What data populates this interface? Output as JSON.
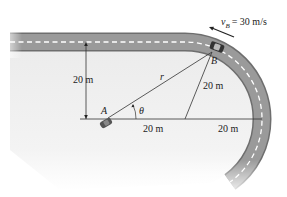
{
  "figure": {
    "velocity_label": "v",
    "velocity_sub": "B",
    "velocity_value": "= 30 m/s",
    "point_A": "A",
    "point_B": "B",
    "radius_label": "r",
    "angle_label": "θ",
    "dim_vertical": "20 m",
    "dim_diagonal": "20 m",
    "dim_horizontal_left": "20 m",
    "dim_horizontal_right": "20 m"
  },
  "colors": {
    "road": "#8f8f8f",
    "road_edge": "#6e6e6e",
    "lane_marking": "#ffffff",
    "ground": "#efefef",
    "lines": "#333333"
  }
}
